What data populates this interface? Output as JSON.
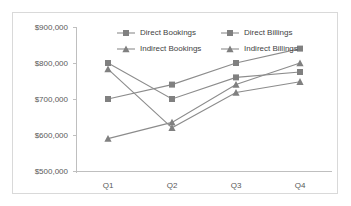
{
  "chart_data": {
    "type": "line",
    "title": "",
    "xlabel": "",
    "ylabel": "",
    "categories": [
      "Q1",
      "Q2",
      "Q3",
      "Q4"
    ],
    "ylim": [
      500000,
      900000
    ],
    "ytick_values": [
      900000,
      800000,
      700000,
      600000,
      500000
    ],
    "ytick_labels": [
      "$900,000",
      "$800,000",
      "$700,000",
      "$600,000",
      "$500,000"
    ],
    "grid": false,
    "legend_position": "top",
    "series": [
      {
        "name": "Direct Bookings",
        "marker": "square",
        "color": "#808080",
        "values": [
          700000,
          740000,
          800000,
          840000
        ]
      },
      {
        "name": "Direct Billings",
        "marker": "square",
        "color": "#808080",
        "values": [
          800000,
          700000,
          760000,
          775000
        ]
      },
      {
        "name": "Indirect Bookings",
        "marker": "triangle",
        "color": "#808080",
        "values": [
          590000,
          635000,
          740000,
          800000
        ]
      },
      {
        "name": "Indirect Billings",
        "marker": "triangle",
        "color": "#808080",
        "values": [
          783000,
          620000,
          718000,
          748000
        ]
      }
    ]
  },
  "legend": {
    "entries": [
      {
        "label": "Direct Bookings",
        "marker": "square"
      },
      {
        "label": "Direct Billings",
        "marker": "square"
      },
      {
        "label": "Indirect Bookings",
        "marker": "triangle"
      },
      {
        "label": "Indirect Billings",
        "marker": "triangle"
      }
    ]
  },
  "axis": {
    "y_labels": [
      "$900,000",
      "$800,000",
      "$700,000",
      "$600,000",
      "$500,000"
    ],
    "x_labels": [
      "Q1",
      "Q2",
      "Q3",
      "Q4"
    ]
  },
  "colors": {
    "series": "#808080",
    "line": "#8c8c8c",
    "axis": "#bfbfbf",
    "text": "#595959",
    "border": "#d9d9d9"
  }
}
